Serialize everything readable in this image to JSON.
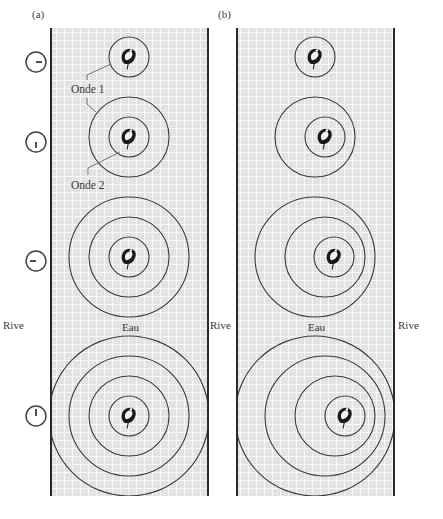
{
  "figure": {
    "panels": [
      {
        "id": "a",
        "label": "(a)",
        "frame": {
          "x1": 51,
          "x2": 208,
          "y1": 28,
          "y2": 496
        },
        "wave_groups": [
          {
            "frog": {
              "x": 129,
              "y": 57
            },
            "rings": [
              {
                "cx": 129,
                "cy": 57,
                "r": 20
              }
            ]
          },
          {
            "frog": {
              "x": 129,
              "y": 137
            },
            "rings": [
              {
                "cx": 129,
                "cy": 137,
                "r": 20
              },
              {
                "cx": 129,
                "cy": 137,
                "r": 40
              }
            ]
          },
          {
            "frog": {
              "x": 129,
              "y": 257
            },
            "rings": [
              {
                "cx": 129,
                "cy": 257,
                "r": 20
              },
              {
                "cx": 129,
                "cy": 257,
                "r": 40
              },
              {
                "cx": 129,
                "cy": 257,
                "r": 60
              }
            ]
          },
          {
            "frog": {
              "x": 129,
              "y": 416
            },
            "rings": [
              {
                "cx": 129,
                "cy": 416,
                "r": 20
              },
              {
                "cx": 129,
                "cy": 416,
                "r": 40
              },
              {
                "cx": 129,
                "cy": 416,
                "r": 60
              },
              {
                "cx": 129,
                "cy": 416,
                "r": 80
              }
            ]
          }
        ],
        "water_label": "Eau"
      },
      {
        "id": "b",
        "label": "(b)",
        "frame": {
          "x1": 237,
          "x2": 394,
          "y1": 28,
          "y2": 496
        },
        "wave_groups": [
          {
            "frog": {
              "x": 315,
              "y": 57
            },
            "rings": [
              {
                "cx": 315,
                "cy": 57,
                "r": 20
              }
            ]
          },
          {
            "frog": {
              "x": 325,
              "y": 137
            },
            "rings": [
              {
                "cx": 325,
                "cy": 137,
                "r": 20
              },
              {
                "cx": 315,
                "cy": 137,
                "r": 40
              }
            ]
          },
          {
            "frog": {
              "x": 334,
              "y": 257
            },
            "rings": [
              {
                "cx": 334,
                "cy": 257,
                "r": 20
              },
              {
                "cx": 325,
                "cy": 257,
                "r": 40
              },
              {
                "cx": 315,
                "cy": 257,
                "r": 60
              }
            ]
          },
          {
            "frog": {
              "x": 345,
              "y": 416
            },
            "rings": [
              {
                "cx": 345,
                "cy": 416,
                "r": 20
              },
              {
                "cx": 335,
                "cy": 416,
                "r": 40
              },
              {
                "cx": 325,
                "cy": 416,
                "r": 60
              },
              {
                "cx": 315,
                "cy": 416,
                "r": 80
              }
            ]
          }
        ],
        "water_label": "Eau"
      }
    ],
    "clocks": [
      {
        "y": 62,
        "hand": "right"
      },
      {
        "y": 142,
        "hand": "down"
      },
      {
        "y": 261,
        "hand": "left"
      },
      {
        "y": 416,
        "hand": "up"
      }
    ],
    "annotations": {
      "wave1": "Onde 1",
      "wave2": "Onde 2"
    },
    "shore_label": "Rive",
    "colors": {
      "water": "#e3e3e3",
      "grid": "#f7f7f7",
      "ring": "#3a3a3a",
      "border": "#2a2a2a"
    }
  }
}
